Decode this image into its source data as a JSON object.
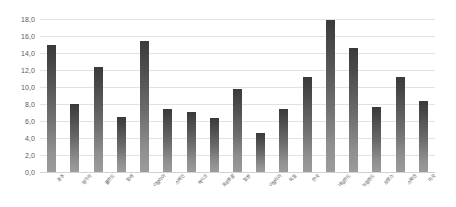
{
  "chart_data": {
    "type": "bar",
    "title": "",
    "subtitle": "",
    "xlabel": "",
    "ylabel": "",
    "ylim": [
      0.0,
      18.0
    ],
    "y_tick_step": 2.0,
    "y_ticks": [
      "0,0",
      "2,0",
      "4,0",
      "6,0",
      "8,0",
      "10,0",
      "12,0",
      "14,0",
      "16,0",
      "18,0"
    ],
    "grid": true,
    "legend": "none",
    "orientation": "vertical",
    "bar_color": "#4a4a4a",
    "bar_color_bottom": "#9c9c9c",
    "grid_color": "#e2e2e2",
    "axis_text_color": "#5a5a5a",
    "background": "#ffffff",
    "categories": [
      "호주",
      "헝가리",
      "폴란드",
      "칠레",
      "이탈리아",
      "스페인",
      "멕시코",
      "포르투갈",
      "일본",
      "이탈리아",
      "독일",
      "한국",
      "네덜란드",
      "뉴질랜드",
      "프랑스",
      "스웨덴",
      "미국"
    ],
    "values": [
      15.0,
      8.0,
      12.3,
      6.5,
      15.4,
      7.4,
      7.1,
      6.3,
      9.8,
      4.6,
      7.4,
      11.2,
      17.9,
      14.6,
      7.7,
      11.2,
      8.3
    ],
    "value_labels": [
      "15,0",
      "8,0",
      "12,3",
      "6,5",
      "15,4",
      "7,4",
      "7,1",
      "6,3",
      "9,8",
      "4,6",
      "7,4",
      "11,2",
      "17,9",
      "14,6",
      "7,7",
      "11,2",
      "8,3"
    ]
  }
}
